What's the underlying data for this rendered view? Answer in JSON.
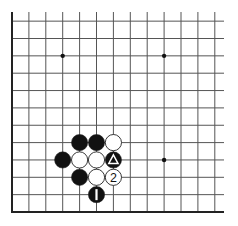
{
  "diagram": {
    "type": "go-board-corner",
    "corner": "bottom-left",
    "columns_visible": 13,
    "rows_visible": 12,
    "colors": {
      "background": "#ffffff",
      "line": "#555555",
      "edge": "#222222",
      "black_stone": "#111111",
      "white_stone": "#ffffff",
      "stone_outline": "#222222"
    },
    "star_points": [
      {
        "col": 3,
        "row": 9
      },
      {
        "col": 9,
        "row": 9
      },
      {
        "col": 9,
        "row": 3
      }
    ],
    "stones": [
      {
        "col": 4,
        "row": 4,
        "color": "black",
        "label": ""
      },
      {
        "col": 5,
        "row": 4,
        "color": "black",
        "label": ""
      },
      {
        "col": 6,
        "row": 4,
        "color": "white",
        "label": ""
      },
      {
        "col": 3,
        "row": 3,
        "color": "black",
        "label": ""
      },
      {
        "col": 4,
        "row": 3,
        "color": "white",
        "label": ""
      },
      {
        "col": 5,
        "row": 3,
        "color": "white",
        "label": ""
      },
      {
        "col": 6,
        "row": 3,
        "color": "black",
        "label": "",
        "marker": "triangle"
      },
      {
        "col": 4,
        "row": 2,
        "color": "black",
        "label": ""
      },
      {
        "col": 5,
        "row": 2,
        "color": "white",
        "label": ""
      },
      {
        "col": 6,
        "row": 2,
        "color": "white",
        "label": "2"
      },
      {
        "col": 5,
        "row": 1,
        "color": "black",
        "label": "1"
      }
    ]
  }
}
